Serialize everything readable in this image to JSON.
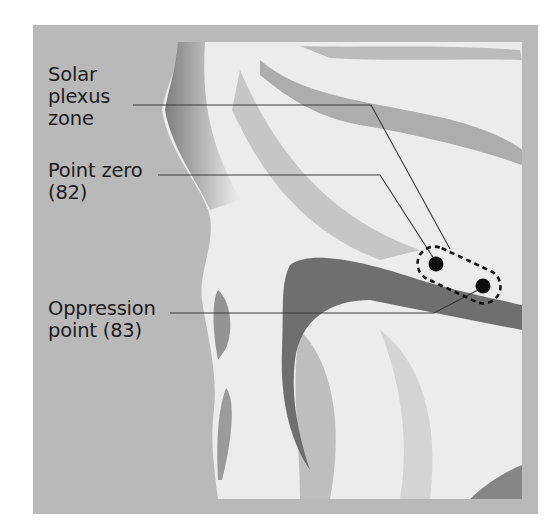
{
  "figure": {
    "labels": [
      {
        "id": "solar-plexus-zone",
        "lines": [
          "Solar",
          "plexus",
          "zone"
        ]
      },
      {
        "id": "point-zero",
        "lines": [
          "Point zero",
          "(82)"
        ]
      },
      {
        "id": "oppression-point",
        "lines": [
          "Oppression",
          "point (83)"
        ]
      }
    ],
    "points": [
      {
        "name": "Point zero",
        "number": "82"
      },
      {
        "name": "Oppression point",
        "number": "83"
      }
    ],
    "zone": "Solar plexus zone",
    "colors": {
      "panel": "#b9b9b9",
      "ink": "#1c1c1c",
      "leader": "#3a3a3a",
      "skin": "#ececec"
    }
  }
}
